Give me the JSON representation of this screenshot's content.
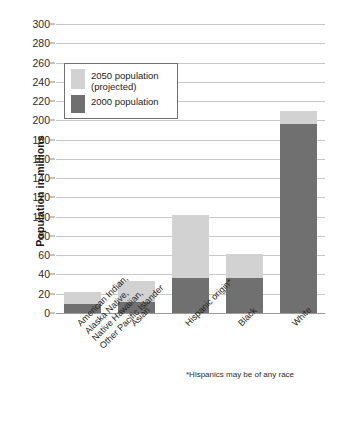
{
  "chart_data": {
    "type": "bar",
    "title": "",
    "subtitle": "",
    "xlabel": "",
    "ylabel": "Population in millions",
    "ylim": [
      0,
      300
    ],
    "ytick_step": 20,
    "yticks": [
      0,
      20,
      40,
      60,
      80,
      100,
      120,
      140,
      160,
      180,
      200,
      220,
      240,
      260,
      280,
      300
    ],
    "grid": true,
    "legend_position": "upper-left-inside",
    "stacked": "overlay-total",
    "categories": [
      "American Indian, Alaska Native, Native Hawaiian, Other Pacific Islander",
      "Asian",
      "Hispanic origin*",
      "Black",
      "White"
    ],
    "category_lines": [
      [
        "American Indian,",
        "Alaska Native,",
        "Native Hawaiian,",
        "Other Pacific Islander"
      ],
      [
        "Asian"
      ],
      [
        "Hispanic origin*"
      ],
      [
        "Black"
      ],
      [
        "White"
      ]
    ],
    "series": [
      {
        "name": "2050 population (projected)",
        "color": "#d2d2d2",
        "values": [
          22,
          33,
          102,
          61,
          210
        ]
      },
      {
        "name": "2000 population",
        "color": "#707070",
        "values": [
          9,
          11,
          36,
          36,
          196
        ]
      }
    ],
    "annotations": [
      "*Hispanics may be of any race"
    ]
  },
  "legend": {
    "items": [
      {
        "label_lines": [
          "2050 population",
          "(projected)"
        ],
        "swatch": "#d2d2d2"
      },
      {
        "label_lines": [
          "2000 population"
        ],
        "swatch": "#707070"
      }
    ]
  },
  "footnote": "*Hispanics may be of any race",
  "colors": {
    "projected": "#d2d2d2",
    "current": "#707070",
    "gridline": "#c8c8c8",
    "axis": "#9a9a9a",
    "text": "#1a1a1a",
    "background": "#ffffff"
  }
}
